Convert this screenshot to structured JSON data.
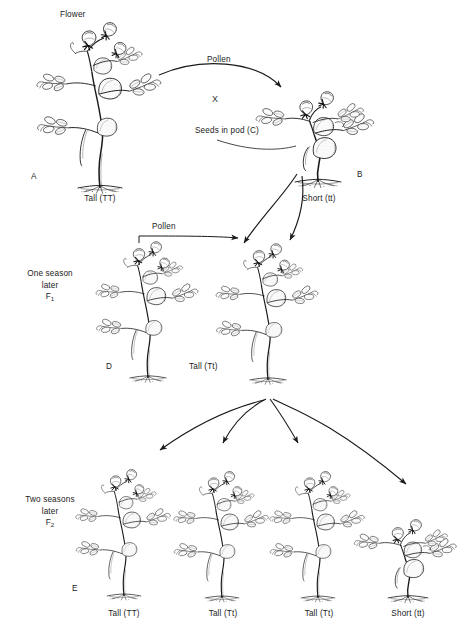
{
  "figure": {
    "background_color": "#ffffff",
    "ink_color": "#1a1a1a",
    "annotations": {
      "flower": "Flower",
      "pollen_top": "Pollen",
      "cross_symbol": "X",
      "seeds_in_pod": "Seeds in pod (C)",
      "pollen_f1": "Pollen"
    },
    "generations": [
      {
        "id": "parental",
        "stage_label": "",
        "plants": [
          {
            "key": "A",
            "letter": "A",
            "caption": "Tall (TT)",
            "height": "tall"
          },
          {
            "key": "B",
            "letter": "B",
            "caption": "Short (tt)",
            "height": "short"
          }
        ]
      },
      {
        "id": "f1",
        "stage_label_line1": "One season",
        "stage_label_line2": "later",
        "stage_label_line3": "F",
        "stage_label_sub": "1",
        "plants": [
          {
            "key": "D",
            "letter": "D",
            "caption": "Tall (Tt)",
            "height": "tall"
          },
          {
            "key": "D2",
            "letter": "",
            "caption": "",
            "height": "tall"
          }
        ]
      },
      {
        "id": "f2",
        "stage_label_line1": "Two seasons",
        "stage_label_line2": "later",
        "stage_label_line3": "F",
        "stage_label_sub": "2",
        "plants": [
          {
            "key": "E",
            "letter": "E",
            "caption": "Tall (TT)",
            "height": "tall"
          },
          {
            "key": "E2",
            "letter": "",
            "caption": "Tall (Tt)",
            "height": "tall"
          },
          {
            "key": "E3",
            "letter": "",
            "caption": "Tall (Tt)",
            "height": "tall"
          },
          {
            "key": "E4",
            "letter": "",
            "caption": "Short (tt)",
            "height": "short"
          }
        ]
      }
    ]
  }
}
